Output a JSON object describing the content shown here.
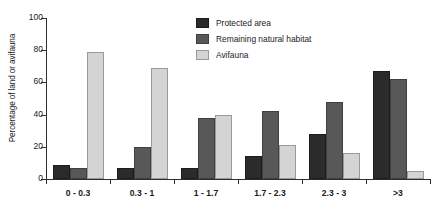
{
  "chart_data": {
    "type": "bar",
    "title": "",
    "subtitle": "",
    "xlabel": "",
    "ylabel": "Percentage of land or avifauna",
    "categories": [
      "0 - 0.3",
      "0.3 - 1",
      "1 - 1.7",
      "1.7 - 2.3",
      "2.3 - 3",
      ">3"
    ],
    "series": [
      {
        "name": "Protected area",
        "color": "#2b2b2b",
        "values": [
          9,
          7,
          7,
          14,
          28,
          67
        ]
      },
      {
        "name": "Remaining natural habitat",
        "color": "#585858",
        "values": [
          7,
          20,
          38,
          42,
          48,
          62
        ]
      },
      {
        "name": "Avifauna",
        "color": "#d4d4d4",
        "values": [
          79,
          69,
          40,
          21,
          16,
          5
        ]
      }
    ],
    "ylim": [
      0,
      100
    ],
    "yticks": [
      0,
      20,
      40,
      60,
      80,
      100
    ],
    "ytick_labels": [
      "0",
      "20",
      "40",
      "60",
      "80",
      "100"
    ],
    "grid": false,
    "legend_position": "top-center"
  }
}
